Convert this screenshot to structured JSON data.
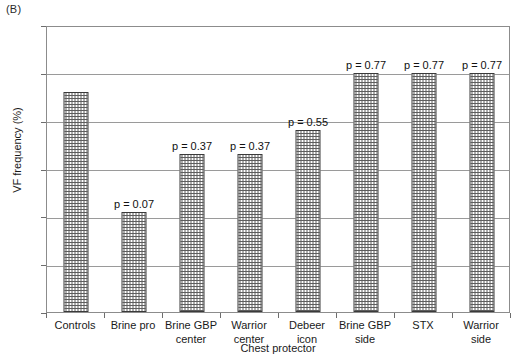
{
  "panel": {
    "label": "(B)"
  },
  "chart_data": {
    "type": "bar",
    "title": "",
    "panel_label": "(B)",
    "xlabel": "Chest protector",
    "ylabel": "VF frequency (%)",
    "ylim": [
      0,
      60
    ],
    "yticks": [
      0,
      10,
      20,
      30,
      40,
      50,
      60
    ],
    "ytick_labels": [
      "0",
      "10",
      "20",
      "30",
      "40",
      "50",
      "60"
    ],
    "grid": "horizontal",
    "legend": "none",
    "categories": [
      "Controls",
      "Brine pro",
      "Brine GBP center",
      "Warrior center",
      "Debeer icon",
      "Brine GBP side",
      "STX",
      "Warrior side"
    ],
    "category_lines": [
      [
        "Controls"
      ],
      [
        "Brine pro"
      ],
      [
        "Brine GBP",
        "center"
      ],
      [
        "Warrior",
        "center"
      ],
      [
        "Debeer icon"
      ],
      [
        "Brine GBP",
        "side"
      ],
      [
        "STX"
      ],
      [
        "Warrior side"
      ]
    ],
    "values": [
      46,
      21,
      33,
      33,
      38,
      50,
      50,
      50
    ],
    "annotations": [
      "",
      "p = 0.07",
      "p = 0.37",
      "p = 0.37",
      "p = 0.55",
      "p = 0.77",
      "p = 0.77",
      "p = 0.77"
    ],
    "bar_fill": "checkered-dot",
    "bar_outline_color": "#3a3a3a",
    "gridline_color": "#9a9a9a",
    "axis_color": "#8c8c8c"
  }
}
